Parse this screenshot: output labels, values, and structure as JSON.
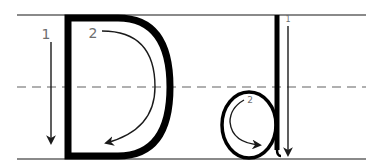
{
  "letters": {
    "uppercase": "D",
    "lowercase": "d"
  },
  "guides": {
    "top": "top line",
    "middle": "dashed midline",
    "bottom": "baseline"
  },
  "strokes": {
    "uppercase": [
      {
        "order": "1",
        "label": "1",
        "direction": "down"
      },
      {
        "order": "2",
        "label": "2",
        "direction": "clockwise curve"
      }
    ],
    "lowercase": [
      {
        "order": "1",
        "label": "1",
        "direction": "down"
      },
      {
        "order": "2",
        "label": "2",
        "direction": "counter-clockwise circle"
      }
    ]
  },
  "colors": {
    "glyph": "#000000",
    "guide": "#8a8a8a",
    "dash": "#b0b0b0",
    "number": "#6e6e6e"
  }
}
